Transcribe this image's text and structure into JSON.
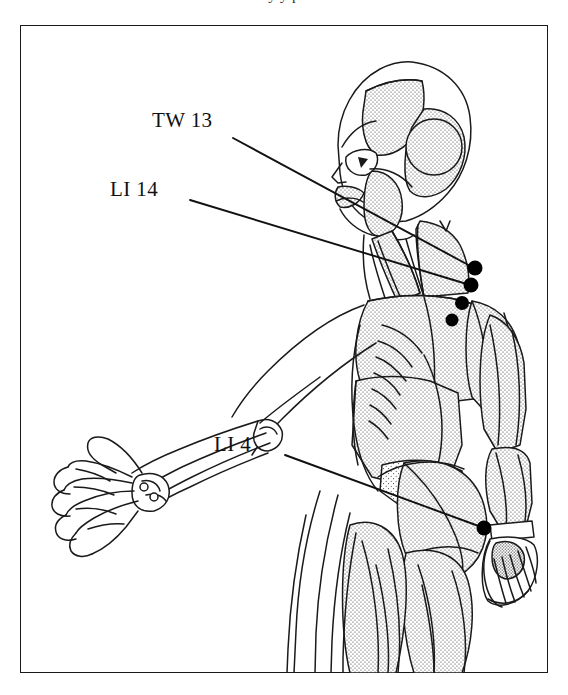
{
  "page": {
    "width": 568,
    "height": 695,
    "background_color": "#ffffff",
    "ink_color": "#1a1a1a",
    "top_cropped_text": "y y p"
  },
  "frame": {
    "name": "plate-border",
    "x": 20,
    "y": 25,
    "width": 528,
    "height": 648,
    "stroke_color": "#1a1a1a",
    "stroke_width": 1.6
  },
  "figure": {
    "view": "three-quarter posterior",
    "rendering": "pen-and-ink line drawing with stipple shading",
    "fill_color": "#ffffff"
  },
  "labels": [
    {
      "id": "tw13",
      "text": "TW 13",
      "meridian": "Triple Warmer",
      "point_number": "13",
      "label_x": 152,
      "label_y": 108,
      "leader_from_x": 233,
      "leader_from_y": 138,
      "leader_to_x": 474,
      "leader_to_y": 268
    },
    {
      "id": "li14",
      "text": "LI 14",
      "meridian": "Large Intestine",
      "point_number": "14",
      "label_x": 110,
      "label_y": 177,
      "leader_from_x": 190,
      "leader_from_y": 200,
      "leader_to_x": 470,
      "leader_to_y": 285
    },
    {
      "id": "li4",
      "text": "LI 4",
      "meridian": "Large Intestine",
      "point_number": "4",
      "label_x": 214,
      "label_y": 432,
      "leader_from_x": 285,
      "leader_from_y": 455,
      "leader_to_x": 484,
      "leader_to_y": 528
    }
  ],
  "acupoints": [
    {
      "id": "pt-1",
      "x": 475,
      "y": 268,
      "r": 7.5,
      "region": "posterior deltoid / upper arm",
      "color": "#000000"
    },
    {
      "id": "pt-2",
      "x": 471,
      "y": 285,
      "r": 7.5,
      "region": "deltoid",
      "color": "#000000"
    },
    {
      "id": "pt-3",
      "x": 462,
      "y": 303,
      "r": 7.0,
      "region": "deltoid insertion",
      "color": "#000000"
    },
    {
      "id": "pt-4",
      "x": 452,
      "y": 320,
      "r": 6.5,
      "region": "lateral upper arm",
      "color": "#000000"
    },
    {
      "id": "pt-5",
      "x": 484,
      "y": 528,
      "r": 7.5,
      "region": "dorsum of right hand (first dorsal interosseous)",
      "color": "#000000"
    }
  ],
  "leader_lines": {
    "stroke_color": "#111111",
    "stroke_width": 1.9
  }
}
